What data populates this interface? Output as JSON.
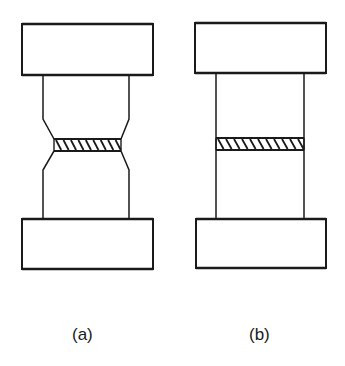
{
  "figure": {
    "colors": {
      "stroke": "#1a1a1a",
      "background": "#ffffff"
    },
    "panels": [
      {
        "id": "a",
        "label": "(a)",
        "shape": "necked (waisted) specimen with hatched bond layer at narrow section",
        "top_block": {
          "x": 22,
          "y": 24,
          "w": 131,
          "h": 51
        },
        "bottom_block": {
          "x": 22,
          "y": 219,
          "w": 131,
          "h": 50
        },
        "body_left_x": 43,
        "body_right_x": 129,
        "neck_left_x": 54,
        "neck_right_x": 121,
        "taper_top_start_y": 119,
        "band_top_y": 139,
        "band_bottom_y": 151,
        "taper_bottom_end_y": 170,
        "hatch_count": 9
      },
      {
        "id": "b",
        "label": "(b)",
        "shape": "straight cylindrical specimen with hatched bond layer",
        "top_block": {
          "x": 195,
          "y": 23,
          "w": 131,
          "h": 50
        },
        "bottom_block": {
          "x": 196,
          "y": 219,
          "w": 130,
          "h": 49
        },
        "body_left_x": 216,
        "body_right_x": 304,
        "band_top_y": 138,
        "band_bottom_y": 150,
        "hatch_count": 11
      }
    ]
  }
}
